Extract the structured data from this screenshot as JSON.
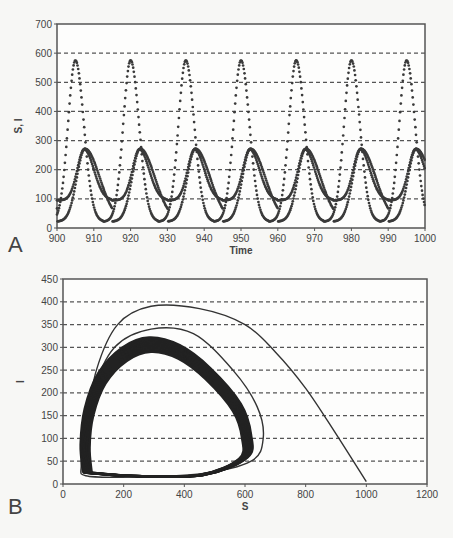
{
  "chart_data": [
    {
      "panel": "A",
      "type": "line",
      "title": "",
      "xlabel": "Time",
      "ylabel": "S, I",
      "xlim": [
        900,
        1000
      ],
      "ylim": [
        0,
        700
      ],
      "xticks": [
        "900",
        "910",
        "920",
        "930",
        "940",
        "950",
        "960",
        "970",
        "980",
        "990",
        "1000"
      ],
      "yticks": [
        "0",
        "100",
        "200",
        "300",
        "400",
        "500",
        "600",
        "700"
      ],
      "grid": "horizontal dashed",
      "series": [
        {
          "name": "S",
          "peaks_x": [
            905,
            920,
            935,
            950,
            965,
            980,
            995
          ],
          "peak_value": 575,
          "trough_value": 25
        },
        {
          "name": "I",
          "peaks_x": [
            907,
            922,
            937,
            952,
            967,
            982,
            997
          ],
          "peak_value": 270,
          "trough_value": 95
        }
      ],
      "period": 15
    },
    {
      "panel": "B",
      "type": "line",
      "title": "",
      "xlabel": "S",
      "ylabel": "I",
      "xlim": [
        0,
        1200
      ],
      "ylim": [
        0,
        450
      ],
      "xticks": [
        "0",
        "200",
        "400",
        "600",
        "800",
        "1000",
        "1200"
      ],
      "yticks": [
        "0",
        "50",
        "100",
        "150",
        "200",
        "250",
        "300",
        "350",
        "400",
        "450"
      ],
      "grid": "horizontal dashed",
      "series": [
        {
          "name": "phase trajectory",
          "start": [
            1000,
            5
          ],
          "outer_peak": [
            290,
            390
          ],
          "limit_cycle": {
            "S_range": [
              90,
              590
            ],
            "I_range": [
              20,
              290
            ]
          }
        }
      ]
    }
  ],
  "labels": {
    "panel_a": "A",
    "panel_b": "B",
    "a_xlabel": "Time",
    "a_ylabel": "S, I",
    "b_xlabel": "S",
    "b_ylabel": "I"
  }
}
